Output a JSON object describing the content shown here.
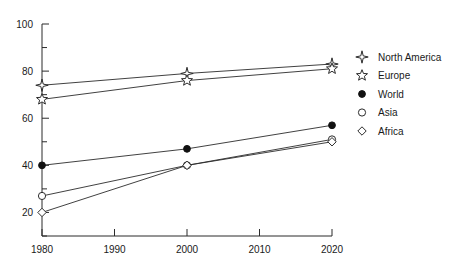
{
  "chart_data": {
    "type": "line",
    "title": "",
    "xlabel": "",
    "ylabel": "",
    "x": [
      1980,
      2000,
      2020
    ],
    "xlim": [
      1980,
      2020
    ],
    "ylim": [
      10,
      100
    ],
    "xticks": [
      1980,
      1990,
      2000,
      2010,
      2020
    ],
    "yticks": [
      20,
      40,
      60,
      80,
      100
    ],
    "yticks_minor": [
      10,
      30,
      50,
      70,
      90
    ],
    "grid": false,
    "legend_position": "right",
    "series": [
      {
        "name": "North America",
        "marker": "four-pointed-star",
        "filled": false,
        "values": [
          74,
          79,
          83
        ]
      },
      {
        "name": "Europe",
        "marker": "five-pointed-star",
        "filled": false,
        "values": [
          68,
          76,
          81
        ]
      },
      {
        "name": "World",
        "marker": "circle",
        "filled": true,
        "values": [
          40,
          47,
          57
        ]
      },
      {
        "name": "Asia",
        "marker": "circle",
        "filled": false,
        "values": [
          27,
          40,
          51
        ]
      },
      {
        "name": "Africa",
        "marker": "diamond",
        "filled": false,
        "values": [
          20,
          40,
          50
        ]
      }
    ]
  },
  "axis": {
    "x_tick_labels": [
      "1980",
      "1990",
      "2000",
      "2010",
      "2020"
    ],
    "y_tick_labels": [
      "20",
      "40",
      "60",
      "80",
      "100"
    ]
  },
  "legend": {
    "items": [
      {
        "label": "North America",
        "icon": "four-pointed-star-icon"
      },
      {
        "label": "Europe",
        "icon": "five-pointed-star-icon"
      },
      {
        "label": "World",
        "icon": "filled-circle-icon"
      },
      {
        "label": "Asia",
        "icon": "open-circle-icon"
      },
      {
        "label": "Africa",
        "icon": "open-diamond-icon"
      }
    ]
  }
}
